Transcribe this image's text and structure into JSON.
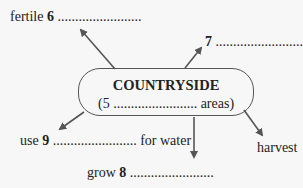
{
  "diagram": {
    "center": {
      "title": "COUNTRYSIDE",
      "subtitle_prefix": "(",
      "subtitle_num": "5",
      "subtitle_blank": " ........................ ",
      "subtitle_suffix": "areas)"
    },
    "nodes": [
      {
        "id": "fertile",
        "prefix": "fertile ",
        "num": "6",
        "blank": " ........................",
        "suffix": ""
      },
      {
        "id": "seven",
        "prefix": "",
        "num": "7",
        "blank": " .........................",
        "suffix": ""
      },
      {
        "id": "use",
        "prefix": "use ",
        "num": "9",
        "blank": " ........................",
        "suffix": " for water"
      },
      {
        "id": "grow",
        "prefix": "grow ",
        "num": "8",
        "blank": " ........................",
        "suffix": ""
      },
      {
        "id": "harvest",
        "prefix": "harvest",
        "num": "",
        "blank": "",
        "suffix": ""
      }
    ],
    "colors": {
      "arrow": "#555555",
      "text": "#222222",
      "background": "#f7f7f7"
    }
  }
}
